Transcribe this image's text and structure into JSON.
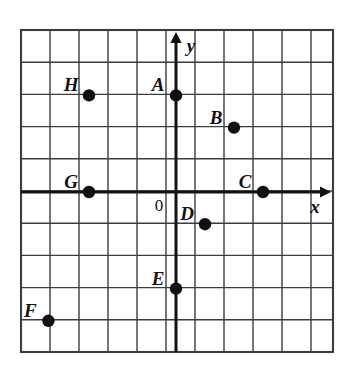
{
  "chart_data": {
    "type": "scatter",
    "title": "",
    "xlabel": "x",
    "ylabel": "y",
    "grid": true,
    "legend": false,
    "origin_label": "0",
    "xlim": [
      -5.345,
      5.414
    ],
    "ylim": [
      -5.0,
      5.0625
    ],
    "x_ticks": [
      -5,
      -4,
      -3,
      -2,
      -1,
      0,
      1,
      2,
      3,
      4,
      5
    ],
    "y_ticks": [
      -5,
      -4,
      -3,
      -2,
      -1,
      0,
      1,
      2,
      3,
      4,
      5
    ],
    "tick_labels_shown": false,
    "points": [
      {
        "label": "A",
        "x": 0,
        "y": 3,
        "label_dx": -0.62,
        "label_dy": 0.34
      },
      {
        "label": "B",
        "x": 2,
        "y": 2,
        "label_dx": -0.62,
        "label_dy": 0.34
      },
      {
        "label": "C",
        "x": 3,
        "y": 0,
        "label_dx": -0.62,
        "label_dy": 0.34
      },
      {
        "label": "D",
        "x": 1,
        "y": -1,
        "label_dx": -0.62,
        "label_dy": 0.34
      },
      {
        "label": "E",
        "x": 0,
        "y": -3,
        "label_dx": -0.62,
        "label_dy": 0.34
      },
      {
        "label": "F",
        "x": -4.4,
        "y": -4,
        "label_dx": -0.62,
        "label_dy": 0.34
      },
      {
        "label": "G",
        "x": -3,
        "y": 0,
        "label_dx": -0.62,
        "label_dy": 0.34
      },
      {
        "label": "H",
        "x": -3,
        "y": 3,
        "label_dx": -0.62,
        "label_dy": 0.34
      }
    ]
  },
  "figure": {
    "grid_color": "#3c3c3c",
    "axis_color": "#111111",
    "point_color": "#101010",
    "background": "#ffffff",
    "grid_line_width": 1.4,
    "axis_line_width": 3.0,
    "point_radius": 6.2
  },
  "geometry": {
    "left": 21,
    "right": 333,
    "top": 30,
    "bottom": 352,
    "origin_x": 176,
    "origin_y": 192,
    "cell_width": 29,
    "cell_height": 32.2,
    "y_axis_arrow_tip_y": 32,
    "x_axis_arrow_tip_x": 331
  },
  "labels": {
    "x_axis": {
      "text": "x",
      "px": 315,
      "py": 206
    },
    "y_axis": {
      "text": "y",
      "px": 191,
      "py": 45
    },
    "origin": {
      "text": "0",
      "px": 159,
      "py": 205
    }
  }
}
